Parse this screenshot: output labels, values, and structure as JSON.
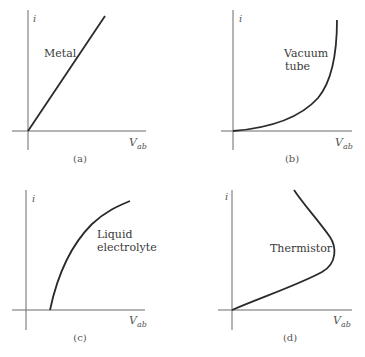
{
  "figure": {
    "panels": [
      {
        "id": "a",
        "caption": "(a)",
        "curve_label": [
          "Metal"
        ],
        "y_axis_label": "i",
        "x_axis_label": "V",
        "x_axis_subscript": "ab",
        "curve_type": "linear through origin"
      },
      {
        "id": "b",
        "caption": "(b)",
        "curve_label": [
          "Vacuum",
          "tube"
        ],
        "y_axis_label": "i",
        "x_axis_label": "V",
        "x_axis_subscript": "ab",
        "curve_type": "exponential-like rise from origin"
      },
      {
        "id": "c",
        "caption": "(c)",
        "curve_label": [
          "Liquid",
          "electrolyte"
        ],
        "y_axis_label": "i",
        "x_axis_label": "V",
        "x_axis_subscript": "ab",
        "curve_type": "concave rise starting at positive V threshold"
      },
      {
        "id": "d",
        "caption": "(d)",
        "curve_label": [
          "Thermistor"
        ],
        "y_axis_label": "i",
        "x_axis_label": "V",
        "x_axis_subscript": "ab",
        "curve_type": "rises from origin, bends back (negative resistance)"
      }
    ]
  }
}
